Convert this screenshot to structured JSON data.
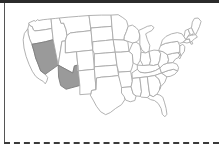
{
  "page": {
    "background_color": "#ffffff"
  },
  "decorations": {
    "top_rule": {
      "name": "top-rule",
      "color": "#2b2b2b",
      "style": "solid"
    },
    "left_rule": {
      "name": "left-rule",
      "color": "#555555",
      "style": "solid"
    },
    "dashed_rule": {
      "name": "dashed-rule",
      "color": "#3a3a3a",
      "style": "dashed"
    }
  },
  "map": {
    "name": "united-states-choropleth",
    "projection": "albers-usa",
    "default_fill": "#ffffff",
    "border_color": "#a9a9a9",
    "highlight_fill": "#9a9a9a",
    "highlight_border": "#7d7d7d",
    "highlighted_states": [
      "Nevada",
      "Arizona"
    ],
    "legend": null,
    "labels_visible": false,
    "states": [
      {
        "code": "WA",
        "name": "Washington",
        "highlighted": false
      },
      {
        "code": "OR",
        "name": "Oregon",
        "highlighted": false
      },
      {
        "code": "CA",
        "name": "California",
        "highlighted": false
      },
      {
        "code": "NV",
        "name": "Nevada",
        "highlighted": true
      },
      {
        "code": "ID",
        "name": "Idaho",
        "highlighted": false
      },
      {
        "code": "MT",
        "name": "Montana",
        "highlighted": false
      },
      {
        "code": "WY",
        "name": "Wyoming",
        "highlighted": false
      },
      {
        "code": "UT",
        "name": "Utah",
        "highlighted": false
      },
      {
        "code": "AZ",
        "name": "Arizona",
        "highlighted": true
      },
      {
        "code": "CO",
        "name": "Colorado",
        "highlighted": false
      },
      {
        "code": "NM",
        "name": "New Mexico",
        "highlighted": false
      },
      {
        "code": "ND",
        "name": "North Dakota",
        "highlighted": false
      },
      {
        "code": "SD",
        "name": "South Dakota",
        "highlighted": false
      },
      {
        "code": "NE",
        "name": "Nebraska",
        "highlighted": false
      },
      {
        "code": "KS",
        "name": "Kansas",
        "highlighted": false
      },
      {
        "code": "OK",
        "name": "Oklahoma",
        "highlighted": false
      },
      {
        "code": "TX",
        "name": "Texas",
        "highlighted": false
      },
      {
        "code": "MN",
        "name": "Minnesota",
        "highlighted": false
      },
      {
        "code": "IA",
        "name": "Iowa",
        "highlighted": false
      },
      {
        "code": "MO",
        "name": "Missouri",
        "highlighted": false
      },
      {
        "code": "AR",
        "name": "Arkansas",
        "highlighted": false
      },
      {
        "code": "LA",
        "name": "Louisiana",
        "highlighted": false
      },
      {
        "code": "WI",
        "name": "Wisconsin",
        "highlighted": false
      },
      {
        "code": "IL",
        "name": "Illinois",
        "highlighted": false
      },
      {
        "code": "MI",
        "name": "Michigan",
        "highlighted": false
      },
      {
        "code": "IN",
        "name": "Indiana",
        "highlighted": false
      },
      {
        "code": "OH",
        "name": "Ohio",
        "highlighted": false
      },
      {
        "code": "KY",
        "name": "Kentucky",
        "highlighted": false
      },
      {
        "code": "TN",
        "name": "Tennessee",
        "highlighted": false
      },
      {
        "code": "MS",
        "name": "Mississippi",
        "highlighted": false
      },
      {
        "code": "AL",
        "name": "Alabama",
        "highlighted": false
      },
      {
        "code": "GA",
        "name": "Georgia",
        "highlighted": false
      },
      {
        "code": "FL",
        "name": "Florida",
        "highlighted": false
      },
      {
        "code": "SC",
        "name": "South Carolina",
        "highlighted": false
      },
      {
        "code": "NC",
        "name": "North Carolina",
        "highlighted": false
      },
      {
        "code": "VA",
        "name": "Virginia",
        "highlighted": false
      },
      {
        "code": "WV",
        "name": "West Virginia",
        "highlighted": false
      },
      {
        "code": "MD",
        "name": "Maryland",
        "highlighted": false
      },
      {
        "code": "DE",
        "name": "Delaware",
        "highlighted": false
      },
      {
        "code": "PA",
        "name": "Pennsylvania",
        "highlighted": false
      },
      {
        "code": "NJ",
        "name": "New Jersey",
        "highlighted": false
      },
      {
        "code": "NY",
        "name": "New York",
        "highlighted": false
      },
      {
        "code": "CT",
        "name": "Connecticut",
        "highlighted": false
      },
      {
        "code": "RI",
        "name": "Rhode Island",
        "highlighted": false
      },
      {
        "code": "MA",
        "name": "Massachusetts",
        "highlighted": false
      },
      {
        "code": "VT",
        "name": "Vermont",
        "highlighted": false
      },
      {
        "code": "NH",
        "name": "New Hampshire",
        "highlighted": false
      },
      {
        "code": "ME",
        "name": "Maine",
        "highlighted": false
      }
    ]
  }
}
